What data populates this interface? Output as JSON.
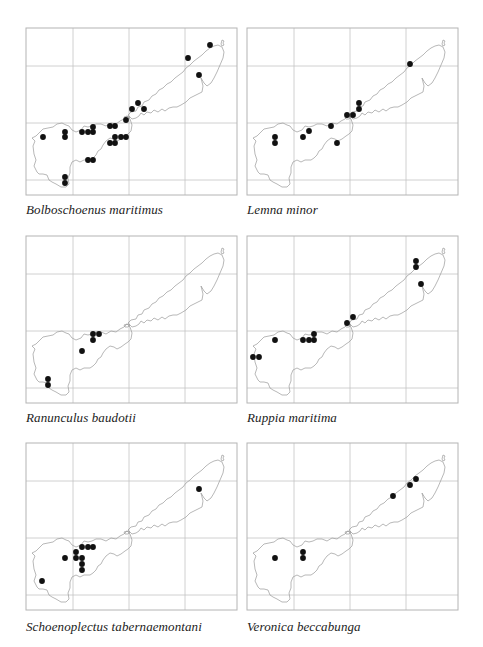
{
  "figure": {
    "frame": {
      "width": 211,
      "height": 167,
      "stroke": "#b4b4b4"
    },
    "grid": {
      "x": [
        47,
        103,
        159
      ],
      "y": [
        38,
        95,
        152
      ],
      "stroke": "#c4c4c4"
    },
    "coast_color": "#9a9a9a",
    "dot_color": "#111111",
    "dot_radius": 2.9,
    "maps": [
      {
        "id": "bolboschoenus",
        "caption": "Bolboschoenus maritimus",
        "pos": {
          "left": 25,
          "top": 27
        },
        "caption_top": 175,
        "dots": [
          [
            17,
            109
          ],
          [
            39,
            104
          ],
          [
            39,
            109
          ],
          [
            56,
            104
          ],
          [
            62,
            104
          ],
          [
            67,
            104
          ],
          [
            67,
            99
          ],
          [
            84,
            98
          ],
          [
            89,
            98
          ],
          [
            89,
            109
          ],
          [
            95,
            109
          ],
          [
            100,
            109
          ],
          [
            84,
            115
          ],
          [
            89,
            115
          ],
          [
            100,
            92
          ],
          [
            62,
            132
          ],
          [
            67,
            132
          ],
          [
            39,
            149
          ],
          [
            39,
            155
          ],
          [
            106,
            81
          ],
          [
            112,
            75
          ],
          [
            118,
            81
          ],
          [
            162,
            30
          ],
          [
            184,
            17
          ],
          [
            173,
            47
          ]
        ]
      },
      {
        "id": "lemna",
        "caption": "Lemna minor",
        "pos": {
          "left": 246,
          "top": 27
        },
        "caption_top": 175,
        "dots": [
          [
            28,
            109
          ],
          [
            28,
            115
          ],
          [
            56,
            109
          ],
          [
            62,
            103
          ],
          [
            84,
            98
          ],
          [
            90,
            115
          ],
          [
            100,
            87
          ],
          [
            106,
            87
          ],
          [
            112,
            75
          ],
          [
            112,
            81
          ],
          [
            163,
            36
          ]
        ]
      },
      {
        "id": "ranunculus",
        "caption": "Ranunculus baudotii",
        "pos": {
          "left": 25,
          "top": 235
        },
        "caption_top": 175,
        "dots": [
          [
            67,
            98
          ],
          [
            73,
            98
          ],
          [
            67,
            104
          ],
          [
            56,
            115
          ],
          [
            22,
            143
          ],
          [
            22,
            149
          ]
        ]
      },
      {
        "id": "ruppia",
        "caption": "Ruppia maritima",
        "pos": {
          "left": 246,
          "top": 235
        },
        "caption_top": 175,
        "dots": [
          [
            6,
            121
          ],
          [
            12,
            121
          ],
          [
            28,
            104
          ],
          [
            56,
            104
          ],
          [
            62,
            104
          ],
          [
            67,
            104
          ],
          [
            67,
            98
          ],
          [
            100,
            87
          ],
          [
            106,
            81
          ],
          [
            169,
            25
          ],
          [
            169,
            31
          ],
          [
            174,
            48
          ]
        ]
      },
      {
        "id": "schoenoplectus",
        "caption": "Schoenoplectus tabernaemontani",
        "pos": {
          "left": 25,
          "top": 442
        },
        "caption_top": 177,
        "dots": [
          [
            56,
            104
          ],
          [
            62,
            104
          ],
          [
            67,
            104
          ],
          [
            39,
            115
          ],
          [
            50,
            109
          ],
          [
            50,
            115
          ],
          [
            56,
            115
          ],
          [
            56,
            121
          ],
          [
            56,
            127
          ],
          [
            16,
            138
          ],
          [
            173,
            46
          ]
        ]
      },
      {
        "id": "veronica",
        "caption": "Veronica beccabunga",
        "pos": {
          "left": 246,
          "top": 442
        },
        "caption_top": 177,
        "dots": [
          [
            28,
            115
          ],
          [
            56,
            109
          ],
          [
            56,
            115
          ],
          [
            146,
            53
          ],
          [
            163,
            42
          ],
          [
            169,
            36
          ]
        ]
      }
    ]
  }
}
